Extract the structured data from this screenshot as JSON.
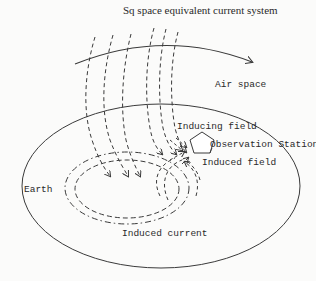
{
  "diagram": {
    "title": "Sq space equivalent current system",
    "labels": {
      "air_space": "Air space",
      "inducing_field": "Inducing field",
      "observation_station": "Observation Station",
      "induced_field": "Induced field",
      "earth": "Earth",
      "induced_current": "Induced current"
    },
    "colors": {
      "stroke": "#3a3a3a",
      "background": "#fbfbfa",
      "text": "#2a2a2a"
    },
    "shapes": {
      "earth_ellipse": {
        "cx": 161,
        "cy": 186,
        "rx": 139,
        "ry": 82
      },
      "observation_station": "pentagon",
      "air_space_arc": "arrow pointing right"
    }
  }
}
